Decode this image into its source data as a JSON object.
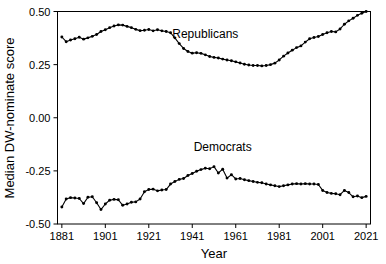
{
  "chart_data": {
    "type": "line",
    "title": "",
    "xlabel": "Year",
    "ylabel": "Median DW-nominate score",
    "xlim": [
      1879,
      2023
    ],
    "ylim": [
      -0.5,
      0.5
    ],
    "grid": false,
    "legend_position": "inline-annotation",
    "xticks": [
      1881,
      1901,
      1921,
      1941,
      1961,
      1981,
      2001,
      2021
    ],
    "xtick_labels": [
      "1881",
      "1901",
      "1921",
      "1941",
      "1961",
      "1981",
      "2001",
      "2021"
    ],
    "yticks": [
      0.5,
      0.25,
      0.0,
      -0.25,
      -0.5
    ],
    "ytick_labels": [
      "0.50",
      "0.25",
      "0.00",
      "-0.25",
      "-0.50"
    ],
    "annotations": [
      {
        "text": "Republicans",
        "x": 1947,
        "y": 0.375
      },
      {
        "text": "Democrats",
        "x": 1955,
        "y": -0.155
      }
    ],
    "x": [
      1881,
      1883,
      1885,
      1887,
      1889,
      1891,
      1893,
      1895,
      1897,
      1899,
      1901,
      1903,
      1905,
      1907,
      1909,
      1911,
      1913,
      1915,
      1917,
      1919,
      1921,
      1923,
      1925,
      1927,
      1929,
      1931,
      1933,
      1935,
      1937,
      1939,
      1941,
      1943,
      1945,
      1947,
      1949,
      1951,
      1953,
      1955,
      1957,
      1959,
      1961,
      1963,
      1965,
      1967,
      1969,
      1971,
      1973,
      1975,
      1977,
      1979,
      1981,
      1983,
      1985,
      1987,
      1989,
      1991,
      1993,
      1995,
      1997,
      1999,
      2001,
      2003,
      2005,
      2007,
      2009,
      2011,
      2013,
      2015,
      2017,
      2019,
      2021
    ],
    "series": [
      {
        "name": "Republicans",
        "color": "#000000",
        "values": [
          0.38,
          0.358,
          0.366,
          0.372,
          0.379,
          0.37,
          0.376,
          0.383,
          0.392,
          0.406,
          0.414,
          0.424,
          0.432,
          0.437,
          0.436,
          0.43,
          0.424,
          0.416,
          0.41,
          0.412,
          0.415,
          0.409,
          0.414,
          0.409,
          0.406,
          0.4,
          0.376,
          0.349,
          0.326,
          0.312,
          0.304,
          0.306,
          0.303,
          0.296,
          0.288,
          0.284,
          0.281,
          0.276,
          0.272,
          0.268,
          0.263,
          0.258,
          0.252,
          0.248,
          0.246,
          0.246,
          0.244,
          0.246,
          0.25,
          0.257,
          0.272,
          0.29,
          0.305,
          0.318,
          0.33,
          0.338,
          0.356,
          0.372,
          0.378,
          0.382,
          0.392,
          0.4,
          0.406,
          0.404,
          0.418,
          0.44,
          0.456,
          0.468,
          0.482,
          0.492,
          0.5
        ]
      },
      {
        "name": "Democrats",
        "color": "#000000",
        "values": [
          -0.42,
          -0.382,
          -0.376,
          -0.378,
          -0.38,
          -0.404,
          -0.374,
          -0.372,
          -0.4,
          -0.432,
          -0.406,
          -0.388,
          -0.384,
          -0.386,
          -0.412,
          -0.406,
          -0.398,
          -0.396,
          -0.382,
          -0.348,
          -0.338,
          -0.336,
          -0.344,
          -0.34,
          -0.338,
          -0.312,
          -0.3,
          -0.29,
          -0.286,
          -0.272,
          -0.262,
          -0.252,
          -0.244,
          -0.238,
          -0.24,
          -0.23,
          -0.26,
          -0.242,
          -0.284,
          -0.268,
          -0.288,
          -0.286,
          -0.292,
          -0.296,
          -0.3,
          -0.304,
          -0.306,
          -0.312,
          -0.316,
          -0.32,
          -0.324,
          -0.32,
          -0.316,
          -0.312,
          -0.31,
          -0.312,
          -0.31,
          -0.312,
          -0.312,
          -0.314,
          -0.342,
          -0.352,
          -0.356,
          -0.358,
          -0.362,
          -0.342,
          -0.352,
          -0.372,
          -0.368,
          -0.376,
          -0.37
        ]
      }
    ]
  }
}
